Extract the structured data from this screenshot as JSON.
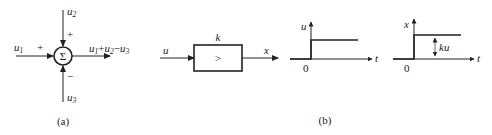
{
  "figure_a": {
    "caption": "(a)",
    "summing_symbol": "Σ",
    "inputs": {
      "u1": {
        "base": "u",
        "sub": "1",
        "sign": "+"
      },
      "u2": {
        "base": "u",
        "sub": "2",
        "sign": "+"
      },
      "u3": {
        "base": "u",
        "sub": "3",
        "sign": "−"
      }
    },
    "output_label": {
      "p1": "u",
      "s1": "1",
      "op1": "+",
      "p2": "u",
      "s2": "2",
      "op2": "−",
      "p3": "u",
      "s3": "3"
    }
  },
  "figure_b": {
    "caption": "(b)",
    "block": {
      "gain_label": "k",
      "symbol": ">",
      "input_label": "u",
      "output_label": "x"
    },
    "input_plot": {
      "y_label": "u",
      "x_label": "t",
      "origin": "0"
    },
    "output_plot": {
      "y_label": "x",
      "x_label": "t",
      "origin": "0",
      "step_annotation": "ku"
    }
  }
}
